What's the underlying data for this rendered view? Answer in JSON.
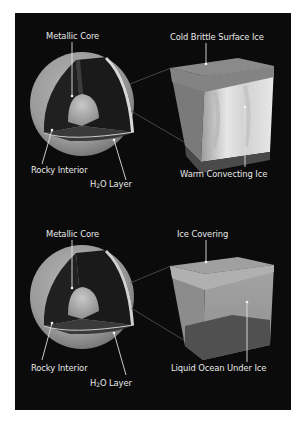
{
  "figure": {
    "panels": [
      {
        "id": "ice-shell",
        "sphere_labels": {
          "core": "Metallic Core",
          "rocky": "Rocky Interior",
          "h2o_prefix": "H",
          "h2o_sub": "2",
          "h2o_suffix": "O Layer"
        },
        "block_labels": {
          "top": "Cold Brittle Surface Ice",
          "bottom": "Warm Convecting Ice"
        }
      },
      {
        "id": "ocean",
        "sphere_labels": {
          "core": "Metallic Core",
          "rocky": "Rocky Interior",
          "h2o_prefix": "H",
          "h2o_sub": "2",
          "h2o_suffix": "O Layer"
        },
        "block_labels": {
          "top": "Ice Covering",
          "bottom": "Liquid Ocean Under Ice"
        }
      }
    ],
    "colors": {
      "background": "#0b0b0b",
      "label": "#e8e8e8",
      "page": "#ffffff"
    }
  }
}
